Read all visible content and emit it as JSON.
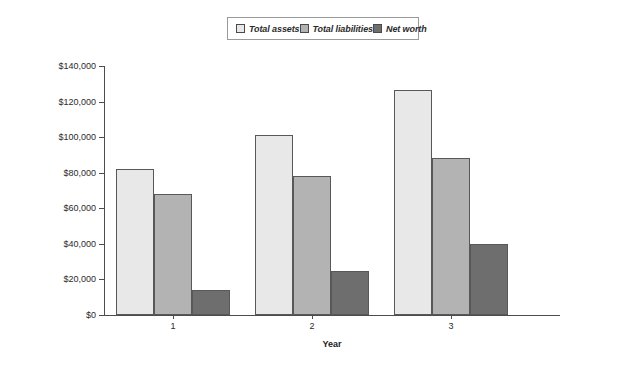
{
  "legend": {
    "position": "top-center",
    "items": [
      {
        "label": "Total assets",
        "color": "#e8e8e8",
        "icon": "legend-swatch-icon"
      },
      {
        "label": "Total liabilities",
        "color": "#b3b3b3",
        "icon": "legend-swatch-icon"
      },
      {
        "label": "Net worth",
        "color": "#6e6e6e",
        "icon": "legend-swatch-icon"
      }
    ]
  },
  "axes": {
    "y_ticks": [
      "$0",
      "$20,000",
      "$40,000",
      "$60,000",
      "$80,000",
      "$100,000",
      "$120,000",
      "$140,000"
    ],
    "x_title": "Year",
    "x_ticks": [
      "1",
      "2",
      "3"
    ]
  },
  "chart_data": {
    "type": "bar",
    "title": "",
    "xlabel": "Year",
    "ylabel": "",
    "categories": [
      "1",
      "2",
      "3"
    ],
    "series": [
      {
        "name": "Total assets",
        "color": "#e8e8e8",
        "values": [
          82000,
          101000,
          126500
        ]
      },
      {
        "name": "Total liabilities",
        "color": "#b3b3b3",
        "values": [
          68000,
          78000,
          88500
        ]
      },
      {
        "name": "Net worth",
        "color": "#6e6e6e",
        "values": [
          14000,
          24500,
          40000
        ]
      }
    ],
    "ylim": [
      0,
      140000
    ],
    "ytick_step": 20000,
    "ytick_values": [
      0,
      20000,
      40000,
      60000,
      80000,
      100000,
      120000,
      140000
    ],
    "ytick_labels": [
      "$0",
      "$20,000",
      "$40,000",
      "$60,000",
      "$80,000",
      "$100,000",
      "$120,000",
      "$140,000"
    ],
    "grid": false,
    "legend_position": "top-center",
    "bar_outline_color": "#58585a"
  }
}
